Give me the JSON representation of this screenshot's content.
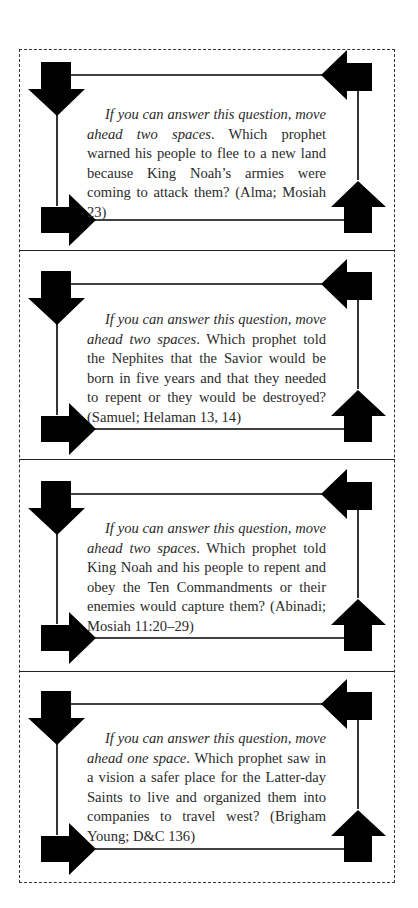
{
  "document": {
    "type": "game-cards",
    "card_count": 4
  },
  "cards": [
    {
      "instruction": "If you can answer this question, move ahead two spaces",
      "question": ". Which prophet warned his people to flee to a new land because King Noah’s armies were coming to attack them? (Alma; Mosiah 23)",
      "answer": "Alma",
      "reference": "Mosiah 23",
      "move_spaces": 2
    },
    {
      "instruction": "If you can answer this question, move ahead two spaces",
      "question": ". Which prophet told the Nephites that the Savior would be born in five years and that they needed to repent or they would be destroyed? (Samuel; Helaman 13, 14)",
      "answer": "Samuel",
      "reference": "Helaman 13, 14",
      "move_spaces": 2
    },
    {
      "instruction": "If you can answer this question, move ahead two spaces",
      "question": ". Which prophet told King Noah and his people to repent and obey the Ten Commandments or their enemies would capture them? (Abinadi; Mosiah 11:20–29)",
      "answer": "Abinadi",
      "reference": "Mosiah 11:20–29",
      "move_spaces": 2
    },
    {
      "instruction": "If you can answer this question, move ahead one space",
      "question": ". Which prophet saw in a vision a safer place for the Latter-day Saints to live and organized them into companies to travel west? (Brigham Young; D&C 136)",
      "answer": "Brigham Young",
      "reference": "D&C 136",
      "move_spaces": 1
    }
  ],
  "frame": {
    "icons": [
      "arrow-down-icon",
      "arrow-left-icon",
      "arrow-right-icon",
      "arrow-up-icon"
    ],
    "color": "#000000"
  }
}
